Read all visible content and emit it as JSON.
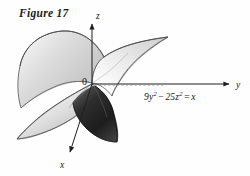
{
  "figure": {
    "caption": "Figure 17",
    "background_color": "#fefefe",
    "stroke_color": "#3a3a3a"
  },
  "axes": {
    "z_label": "z",
    "y_label": "y",
    "x_label": "x",
    "origin_label": "0",
    "z_direction": "up",
    "y_direction": "right",
    "x_direction": "down-left"
  },
  "annotation": {
    "equation_text": "9y2 − 25z2 = x",
    "coef_y": "9",
    "var_y": "y",
    "exp_y": "2",
    "operator": "−",
    "coef_z": "25",
    "var_z": "z",
    "exp_z": "2",
    "equals": "=",
    "rhs": "x"
  },
  "surface": {
    "name": "hyperbolic-paraboloid",
    "description": "saddle surface",
    "light_fill": "#d8d8d8",
    "mid_fill": "#bfbfbf",
    "dark_fill": "#2b2b2b",
    "outline": "#4a4a4a"
  },
  "guides": {
    "dashed_line": "dashed reference line along y axis"
  }
}
